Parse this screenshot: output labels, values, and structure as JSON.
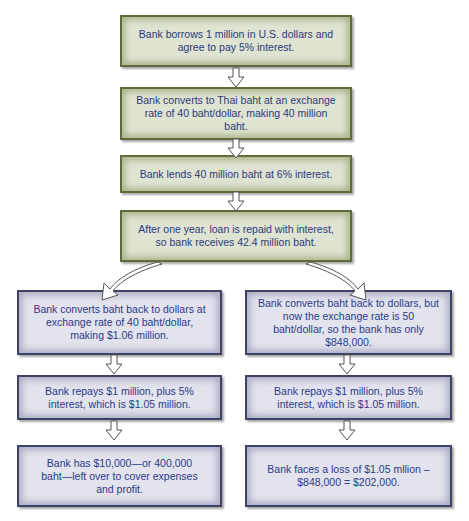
{
  "diagram": {
    "type": "flowchart",
    "colors": {
      "top_box_fill": "#dfe3d2",
      "top_box_border": "#5f6b3a",
      "branch_box_fill": "#e2e3ec",
      "branch_box_border": "#3f4266",
      "text": "#2b3a7a",
      "arrow_fill": "#ffffff",
      "arrow_stroke": "#555555"
    },
    "main_steps": [
      {
        "text": "Bank borrows 1 million in U.S. dollars and agree to pay 5% interest."
      },
      {
        "text": "Bank converts to Thai baht at an exchange rate of 40 baht/dollar, making 40 million baht."
      },
      {
        "text": "Bank lends 40 million baht at 6% interest."
      },
      {
        "text": "After one year, loan is repaid with interest, so bank receives 42.4 million baht."
      }
    ],
    "left_branch": [
      {
        "text": "Bank converts baht back to dollars at exchange rate of 40 baht/dollar, making $1.06 million."
      },
      {
        "text": "Bank repays $1 million, plus 5% interest, which is $1.05 million."
      },
      {
        "text": "Bank has $10,000—or 400,000 baht—left over to cover expenses and profit."
      }
    ],
    "right_branch": [
      {
        "text": "Bank converts baht back to dollars, but now the exchange rate is 50 baht/dollar, so the bank has only $848,000."
      },
      {
        "text": "Bank repays $1 million, plus 5% interest, which is $1.05 million."
      },
      {
        "text": "Bank faces a loss of $1.05 mllion – $848,000 = $202,000."
      }
    ]
  }
}
